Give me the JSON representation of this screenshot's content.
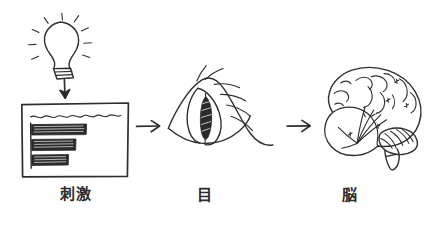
{
  "diagram": {
    "title": "",
    "background_color": "#ffffff",
    "ink_color": "#2e2e2e",
    "style": "hand-drawn sketch",
    "flow_direction": "left-to-right",
    "stages": [
      {
        "index": 1,
        "label": "刺激",
        "label_reading": "shigeki",
        "label_meaning": "stimulus",
        "icon_name": "poster-chart-with-lightbulb",
        "elements": [
          "light-bulb-icon",
          "down-arrow-icon",
          "poster-panel",
          "wavy-title-line",
          "bar-chart-bars"
        ],
        "bar_count": 3
      },
      {
        "index": 2,
        "label": "目",
        "label_reading": "me",
        "label_meaning": "eye",
        "icon_name": "eye-icon",
        "elements": [
          "eye-outline",
          "iris-pupil",
          "eyelashes"
        ],
        "eyelash_count": 6
      },
      {
        "index": 3,
        "label": "脳",
        "label_reading": "nou",
        "label_meaning": "brain",
        "icon_name": "brain-icon",
        "elements": [
          "cerebrum",
          "cerebellum",
          "brainstem",
          "gyri-folds"
        ]
      }
    ],
    "connectors": [
      {
        "name": "arrow-stimulus-to-eye",
        "glyph": "→",
        "from": "刺激",
        "to": "目"
      },
      {
        "name": "arrow-eye-to-brain",
        "glyph": "→",
        "from": "目",
        "to": "脳"
      }
    ]
  }
}
